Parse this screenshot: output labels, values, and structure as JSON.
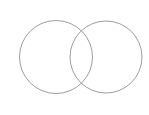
{
  "diagram": {
    "type": "venn",
    "stroke_color": "#9e9e9e",
    "background": "#ffffff",
    "circles": [
      {
        "name": "left-circle",
        "cx": 56,
        "cy": 57,
        "r": 36.5
      },
      {
        "name": "right-circle",
        "cx": 106,
        "cy": 57,
        "r": 36
      }
    ]
  }
}
